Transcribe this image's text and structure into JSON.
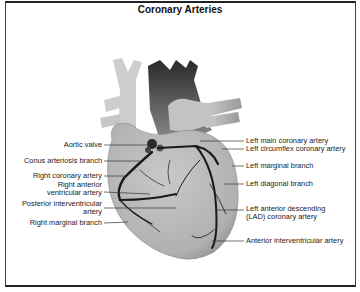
{
  "title": "Coronary Arteries",
  "labels": {
    "left": [
      {
        "id": "aortic-valve",
        "text": "Aortic valve"
      },
      {
        "id": "conus-arteriosis-branch",
        "text": "Conus arteriosis branch"
      },
      {
        "id": "right-coronary-artery",
        "text": "Right coronary artery"
      },
      {
        "id": "right-anterior-ventricular-artery",
        "line1": "Right anterior",
        "line2": "ventricular artery"
      },
      {
        "id": "posterior-interventricular-artery",
        "line1": "Posterior interventricular",
        "line2": "artery"
      },
      {
        "id": "right-marginal-branch",
        "text": "Right marginal branch"
      }
    ],
    "right": [
      {
        "id": "left-main-coronary-artery",
        "text": "Left main coronary artery"
      },
      {
        "id": "left-circumflex-coronary-artery",
        "text": "Left circumflex coronary artery"
      },
      {
        "id": "left-marginal-branch",
        "text": "Left marginal branch"
      },
      {
        "id": "left-diagonal-branch",
        "text": "Left diagonal branch"
      },
      {
        "id": "lad-coronary-artery",
        "line1": "Left anterior descending",
        "line2": "(LAD) coronary artery"
      },
      {
        "id": "anterior-interventricular-artery",
        "text": "Anterior interventricular artery"
      }
    ]
  },
  "colors": {
    "heart_fill": "#b8b8b8",
    "vessel_light": "#cfcfcf",
    "vessel_dark": "#3a3a3a",
    "artery": "#1a1a1a",
    "border": "#333333"
  }
}
